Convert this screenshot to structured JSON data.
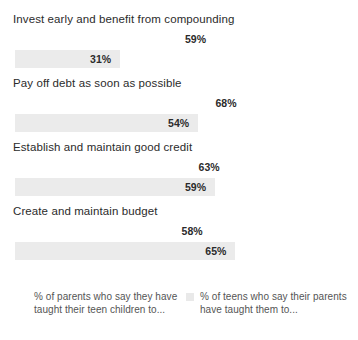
{
  "chart_data": {
    "type": "bar",
    "orientation": "horizontal",
    "grouped": true,
    "title": "",
    "subtitle": "",
    "xlabel": "",
    "ylabel": "",
    "grid": false,
    "legend_position": "bottom",
    "xlim": [
      0,
      100
    ],
    "value_suffix": "%",
    "categories": [
      "Invest early and benefit from compounding",
      "Pay off debt as soon as possible",
      "Establish and maintain good credit",
      "Create and maintain budget"
    ],
    "series": [
      {
        "name": "% of parents who say they have taught their teen children to...",
        "key": "parents",
        "color": "#ffffff",
        "values": [
          59,
          68,
          63,
          58
        ],
        "labels": [
          "59%",
          "68%",
          "63%",
          "58%"
        ]
      },
      {
        "name": "% of teens who say their parents have taught them to...",
        "key": "teens",
        "color": "#ebebeb",
        "values": [
          31,
          54,
          59,
          65
        ],
        "labels": [
          "31%",
          "54%",
          "59%",
          "65%"
        ]
      }
    ]
  },
  "legend": {
    "items": [
      {
        "label": "% of parents who say they have taught their teen children to...",
        "swatch": "#ffffff"
      },
      {
        "label": "% of teens who say their parents have taught them to...",
        "swatch": "#e9e9e9"
      }
    ]
  },
  "colors": {
    "background": "#ffffff",
    "series_parents": "#ffffff",
    "series_teens": "#ebebeb",
    "category_text": "#2b2b2b",
    "value_text": "#2b2b2b",
    "legend_text": "#555555"
  }
}
